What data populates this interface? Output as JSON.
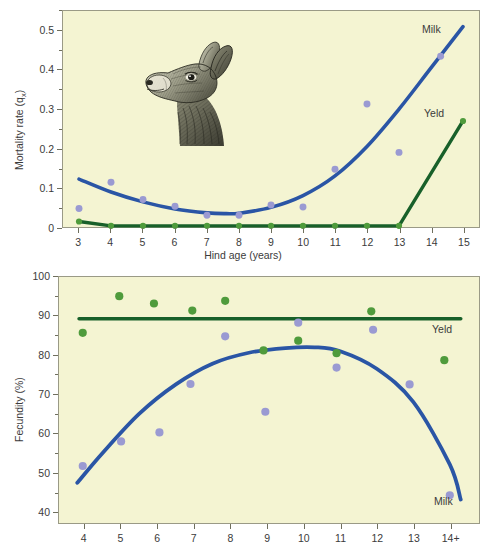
{
  "figure": {
    "background": "#f4f4d2",
    "colors": {
      "milk_line": "#2a55a5",
      "milk_point": "#9a9ad2",
      "yeld_line": "#18602a",
      "yeld_point": "#4f9b3c",
      "frame": "#9a9a86",
      "text": "#3b3b3b"
    },
    "illustration": {
      "name": "red-deer-hind-head",
      "caption": "Pen-and-ink drawing of a red deer hind head in left profile"
    }
  },
  "panels": {
    "top": {
      "ylabel": "Mortality rate (q",
      "ylabel_sub": "x",
      "ylabel_close": ")",
      "xlabel": "Hind age (years)",
      "yticks": [
        "0.5",
        "0.4",
        "0.3",
        "0.2",
        "0.1",
        "0"
      ],
      "xticks": [
        "3",
        "4",
        "5",
        "6",
        "7",
        "8",
        "9",
        "10",
        "11",
        "12",
        "13",
        "14",
        "15"
      ],
      "series_labels": {
        "milk": "Milk",
        "yeld": "Yeld"
      }
    },
    "bottom": {
      "ylabel": "Fecundity (%)",
      "yticks": [
        "100",
        "90",
        "80",
        "70",
        "60",
        "50",
        "40"
      ],
      "xticks": [
        "4",
        "5",
        "6",
        "7",
        "8",
        "9",
        "10",
        "11",
        "12",
        "13",
        "14+"
      ],
      "series_labels": {
        "milk": "Milk",
        "yeld": "Yeld"
      }
    }
  },
  "chart_data": [
    {
      "type": "scatter",
      "id": "mortality",
      "title": "",
      "xlabel": "Hind age (years)",
      "ylabel": "Mortality rate (qx)",
      "xlim": [
        2.5,
        15.5
      ],
      "ylim": [
        0,
        0.55
      ],
      "xticks": [
        3,
        4,
        5,
        6,
        7,
        8,
        9,
        10,
        11,
        12,
        13,
        14,
        15
      ],
      "yticks": [
        0,
        0.1,
        0.2,
        0.3,
        0.4,
        0.5
      ],
      "grid": false,
      "legend_position": "inline-right",
      "series": [
        {
          "name": "Milk",
          "kind": "scatter+fit",
          "color": "#9a9ad2",
          "line_color": "#2a55a5",
          "x": [
            3,
            4,
            5,
            6,
            7,
            8,
            9,
            10,
            11,
            12,
            13,
            14.3
          ],
          "y": [
            0.047,
            0.114,
            0.07,
            0.053,
            0.03,
            0.03,
            0.056,
            0.051,
            0.147,
            0.313,
            0.19,
            0.435
          ],
          "fit": {
            "type": "quadratic-curve",
            "x": [
              3,
              4,
              5,
              6,
              7,
              7.6,
              8,
              9,
              10,
              11,
              12,
              13,
              14,
              15
            ],
            "y": [
              0.122,
              0.089,
              0.064,
              0.046,
              0.036,
              0.034,
              0.035,
              0.05,
              0.08,
              0.13,
              0.205,
              0.3,
              0.405,
              0.51
            ]
          }
        },
        {
          "name": "Yeld",
          "kind": "scatter+line",
          "color": "#4f9b3c",
          "line_color": "#18602a",
          "x": [
            3,
            4,
            5,
            6,
            7,
            8,
            9,
            10,
            11,
            12,
            13,
            15
          ],
          "y": [
            0.014,
            0.003,
            0.003,
            0.003,
            0.003,
            0.003,
            0.003,
            0.003,
            0.003,
            0.003,
            0.003,
            0.27
          ]
        }
      ]
    },
    {
      "type": "scatter",
      "id": "fecundity",
      "title": "",
      "xlabel": "",
      "ylabel": "Fecundity (%)",
      "xlim": [
        3.3,
        14.8
      ],
      "ylim": [
        37,
        100
      ],
      "xticks": [
        4,
        5,
        6,
        7,
        8,
        9,
        10,
        11,
        12,
        13,
        14
      ],
      "xticklabels": [
        "4",
        "5",
        "6",
        "7",
        "8",
        "9",
        "10",
        "11",
        "12",
        "13",
        "14+"
      ],
      "yticks": [
        40,
        50,
        60,
        70,
        80,
        90,
        100
      ],
      "grid": false,
      "legend_position": "inline-right",
      "series": [
        {
          "name": "Milk",
          "kind": "scatter+fit",
          "color": "#9a9ad2",
          "line_color": "#2a55a5",
          "x": [
            3.95,
            5.0,
            6.05,
            6.9,
            7.85,
            8.95,
            9.85,
            10.9,
            11.9,
            12.9,
            14.0
          ],
          "y": [
            51.6,
            57.9,
            60.2,
            72.6,
            84.8,
            65.5,
            88.3,
            76.8,
            86.5,
            72.5,
            44.1
          ],
          "fit": {
            "type": "quadratic-curve",
            "x": [
              3.8,
              4.5,
              5.5,
              6.5,
              7.5,
              8.5,
              9.5,
              10.3,
              11,
              12,
              13,
              14,
              14.3
            ],
            "y": [
              47.3,
              55.0,
              65.0,
              72.5,
              77.8,
              80.6,
              81.8,
              82.0,
              81.0,
              76.5,
              68.0,
              52.0,
              43.0
            ]
          }
        },
        {
          "name": "Yeld",
          "kind": "scatter+line",
          "color": "#4f9b3c",
          "line_color": "#18602a",
          "x": [
            3.95,
            4.95,
            5.9,
            6.95,
            7.85,
            8.9,
            9.85,
            10.9,
            11.85,
            13.85
          ],
          "y": [
            85.7,
            95.1,
            93.2,
            91.4,
            93.9,
            81.2,
            83.7,
            80.5,
            91.2,
            78.7
          ],
          "fit": {
            "type": "horizontal-line",
            "y": 89.3,
            "x": [
              3.85,
              14.3
            ]
          }
        }
      ]
    }
  ]
}
